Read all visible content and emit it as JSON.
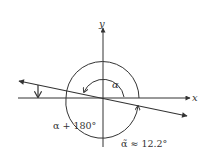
{
  "diagram": {
    "title": "",
    "axes": {
      "x_label": "x",
      "y_label": "y"
    },
    "labels": {
      "alpha": "α",
      "alpha_plus_180": "α + 180°",
      "reference_angle": "α̃ ≈ 12.2°"
    },
    "angles": {
      "reference_angle_deg": 12.2,
      "line_inclination_description": "line through origin with negative slope"
    },
    "colors": {
      "stroke": "#333333",
      "background": "#ffffff"
    }
  }
}
